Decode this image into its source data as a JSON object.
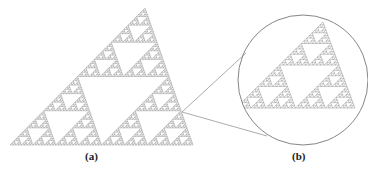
{
  "figure": {
    "panel_a": {
      "label": "(a)"
    },
    "panel_b": {
      "label": "(b)"
    }
  },
  "colors": {
    "fractal": "#8a8a8a",
    "outline": "#777777",
    "background": "#ffffff"
  }
}
